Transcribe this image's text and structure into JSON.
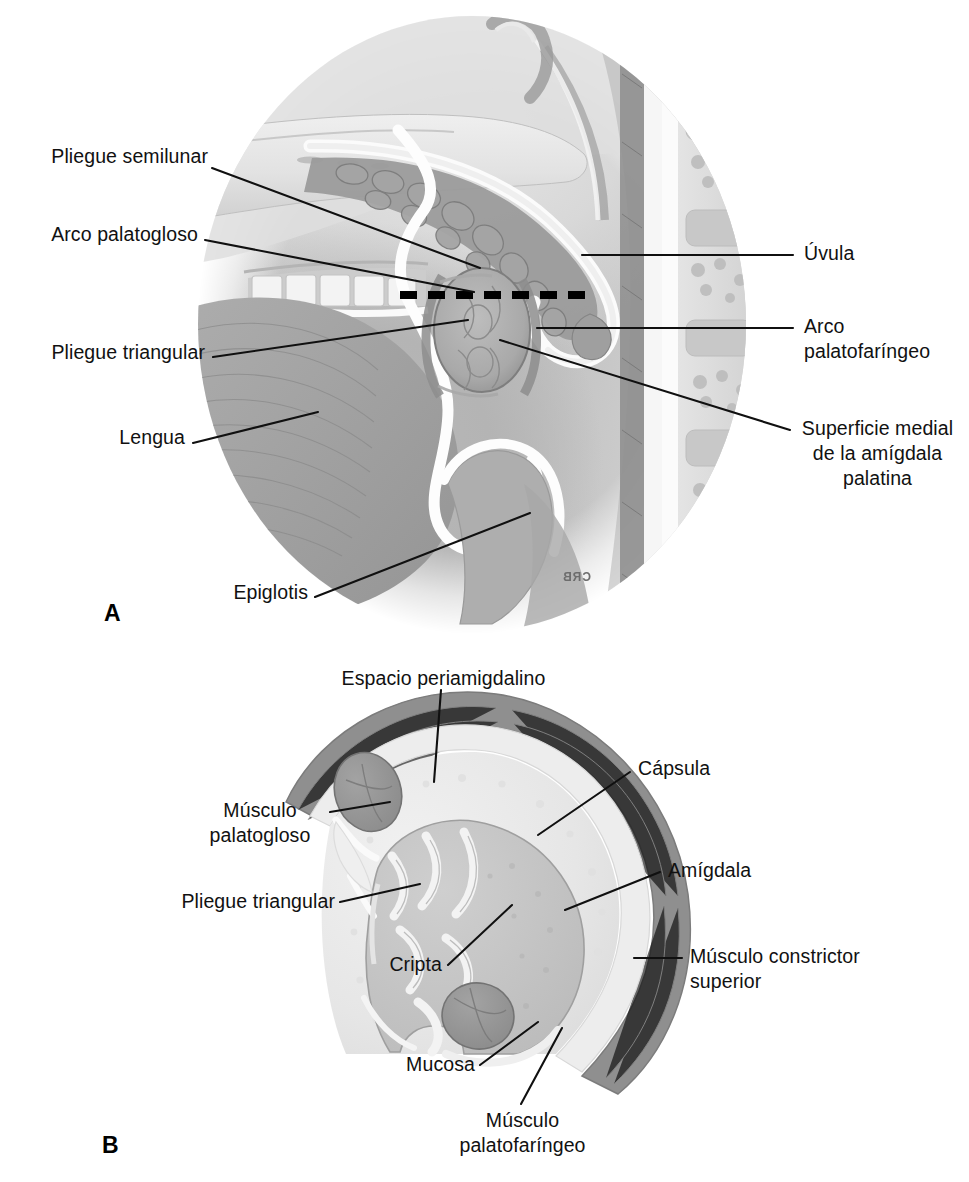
{
  "figure": {
    "language": "es",
    "panels": [
      {
        "id": "A",
        "letter": "A",
        "caption": "Vista oral de la amígdala palatina en corte sagital"
      },
      {
        "id": "B",
        "letter": "B",
        "caption": "Corte transversal de la amígdala palatina"
      }
    ]
  },
  "panel_a": {
    "letter": "A",
    "labels": {
      "pliegue_semilunar": "Pliegue semilunar",
      "arco_palatogloso": "Arco palatogloso",
      "pliegue_triangular": "Pliegue triangular",
      "lengua": "Lengua",
      "epiglotis": "Epiglotis",
      "uvula": "Úvula",
      "arco_palatofaringeo": "Arco\npalatofaríngeo",
      "superficie_medial": "Superficie medial\nde la amígdala\npalatina"
    },
    "artist_signature": "CRB",
    "section_line": "dashed-section-plane"
  },
  "panel_b": {
    "letter": "B",
    "labels": {
      "espacio_periamigdalino": "Espacio periamigdalino",
      "musculo_palatogloso": "Músculo\npalatogloso",
      "pliegue_triangular": "Pliegue triangular",
      "cripta": "Cripta",
      "capsula": "Cápsula",
      "amigdala": "Amígdala",
      "musculo_constrictor_superior": "Músculo constrictor\nsuperior",
      "mucosa": "Mucosa",
      "musculo_palatofaringeo": "Músculo\npalatofaríngeo"
    }
  },
  "colors": {
    "ink": "#101010",
    "text": "#111111",
    "background": "#ffffff",
    "muscle_dark": "#8e8e8e",
    "muscle_mid": "#a6a6a6",
    "capsule_light": "#e9e9e9",
    "tonsil_tissue": "#c6c6c6",
    "tissue_mid": "#bdbdbd",
    "tissue_pale": "#dcdcdc"
  }
}
